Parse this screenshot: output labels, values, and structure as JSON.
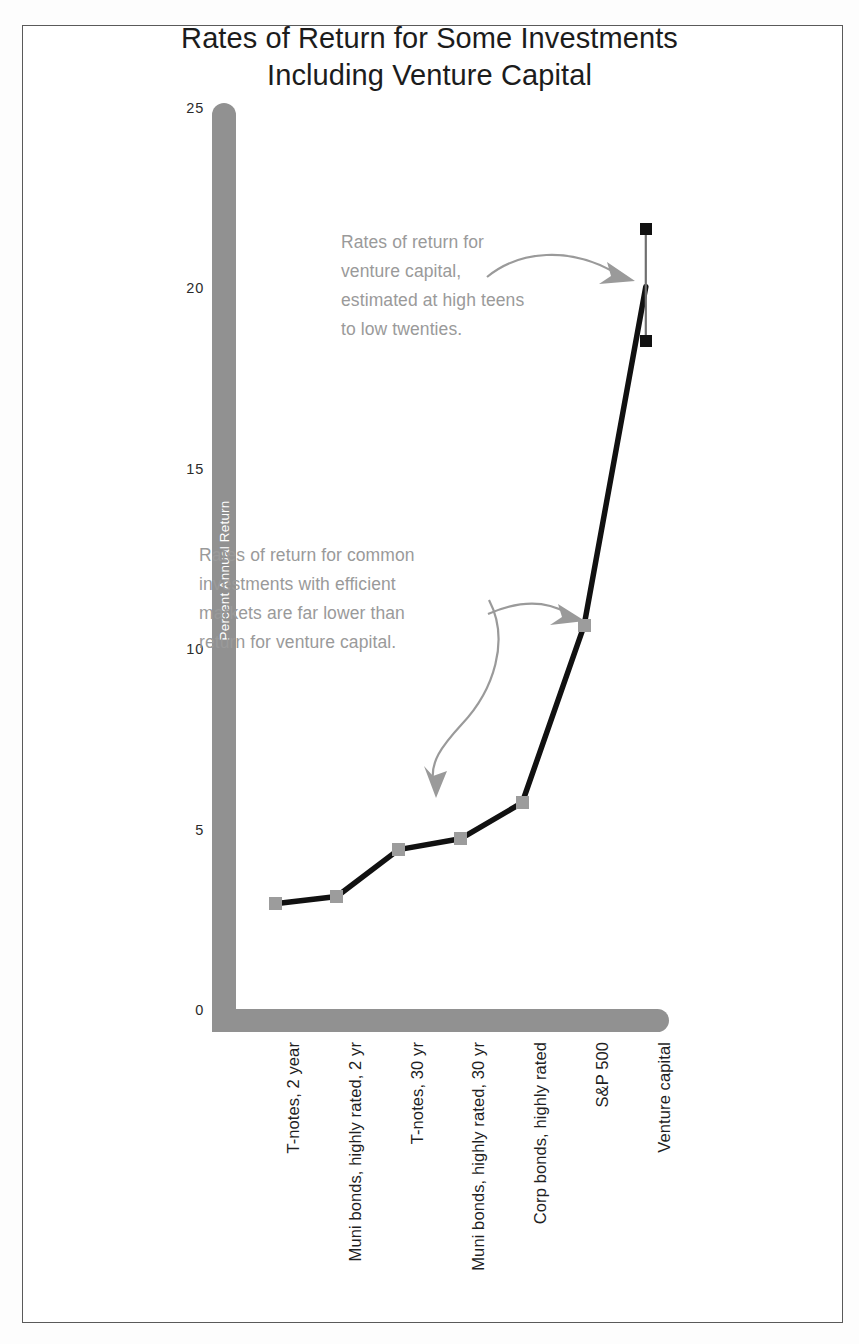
{
  "chart_data": {
    "type": "line",
    "title": "Rates of Return for Some Investments Including Venture Capital",
    "title_lines": [
      "Rates of Return for Some Investments",
      "Including Venture Capital"
    ],
    "xlabel": "",
    "ylabel": "Percent Annual Return",
    "ylim": [
      0,
      25
    ],
    "yticks": [
      0,
      5,
      10,
      15,
      20,
      25
    ],
    "ytick_labels": [
      "0",
      "5",
      "10",
      "15",
      "20",
      "25"
    ],
    "grid": false,
    "legend": false,
    "categories": [
      "T-notes, 2 year",
      "Muni bonds, highly rated, 2 yr",
      "T-notes, 30 yr",
      "Muni bonds, highly rated, 30 yr",
      "Corp bonds, highly rated",
      "S&P 500",
      "Venture capital"
    ],
    "values": [
      3.0,
      3.2,
      4.5,
      4.8,
      5.8,
      10.7,
      20.1
    ],
    "error_bar": {
      "category": "Venture capital",
      "low": 18.6,
      "high": 21.7,
      "center": 20.1
    },
    "annotations": [
      {
        "id": "venture",
        "lines": [
          "Rates of return for",
          "venture capital,",
          "estimated at high teens",
          "to low twenties."
        ],
        "points_to": "Venture capital"
      },
      {
        "id": "common",
        "lines": [
          "Rates of return for common",
          "investments with efficient",
          "markets are far lower than",
          "return for venture capital."
        ],
        "points_to": "S&P 500 and lower investments"
      }
    ],
    "colors": {
      "axis": "#919191",
      "line": "#111111",
      "marker": "#9c9c9c",
      "error_marker": "#111111",
      "annotation_text": "#9a9a9a",
      "annotation_arrow": "#9a9a9a",
      "title_text": "#1c1c1c",
      "axis_title_text": "#ffffff",
      "frame": "#5a5a5a",
      "background": "#ffffff"
    }
  }
}
